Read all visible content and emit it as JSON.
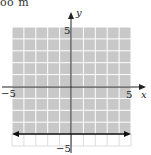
{
  "top_text": "oo m",
  "chart_data": {
    "type": "inequality-graph",
    "title": "",
    "xlabel": "x",
    "ylabel": "y",
    "xlim": [
      -5,
      5
    ],
    "ylim": [
      -5,
      5
    ],
    "grid": true,
    "tick_labels": {
      "x": [
        "-5",
        "5"
      ],
      "y": [
        "5",
        "-5"
      ]
    },
    "boundary_line": {
      "equation": "y = -4",
      "style": "solid",
      "arrows": "both"
    },
    "shaded_region": "y >= -4",
    "colors": {
      "shade": "#c8c8c8",
      "grid_line": "#ffffff",
      "axis": "#222222",
      "boundary": "#111111"
    }
  },
  "labels": {
    "x_axis": "x",
    "y_axis": "y",
    "x_min": "−5",
    "x_max": "5",
    "y_max": "5",
    "y_min": "−5"
  }
}
